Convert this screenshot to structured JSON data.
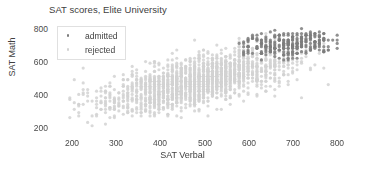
{
  "chart_data": {
    "type": "scatter",
    "title": "SAT scores, Elite University",
    "xlabel": "SAT Verbal",
    "ylabel": "SAT Math",
    "xlim": [
      160,
      840
    ],
    "ylim": [
      150,
      830
    ],
    "xticks": [
      200,
      300,
      400,
      500,
      600,
      700,
      800
    ],
    "yticks": [
      200,
      400,
      600,
      800
    ],
    "grid": false,
    "legend_position": "upper left",
    "series": [
      {
        "name": "admitted",
        "color": "#7d7d7d",
        "marker": "circle",
        "marker_size": 1.6,
        "n_points": 300,
        "description": "Dense dark cluster of accepted applicants with high combined scores, concentrated at SAT Verbal 600-800 and SAT Math 620-790",
        "x_range": [
          580,
          800
        ],
        "y_range": [
          600,
          790
        ],
        "x_mean": 690,
        "y_mean": 695,
        "x_sd": 55,
        "y_sd": 45,
        "correlation": 0.35
      },
      {
        "name": "rejected",
        "color": "#d2d2d2",
        "marker": "circle",
        "marker_size": 1.6,
        "n_points": 1700,
        "description": "Broad light-gray cloud of rejected applicants spanning the full score range with positive correlation between verbal and math",
        "x_range": [
          200,
          800
        ],
        "y_range": [
          200,
          760
        ],
        "x_mean": 485,
        "y_mean": 470,
        "x_sd": 105,
        "y_sd": 95,
        "correlation": 0.62
      }
    ],
    "score_increment": 10,
    "background": "#ffffff",
    "title_color": "#404040",
    "tick_color": "#4a4a4a"
  },
  "legend": {
    "items": [
      {
        "label": "admitted"
      },
      {
        "label": "rejected"
      }
    ]
  }
}
